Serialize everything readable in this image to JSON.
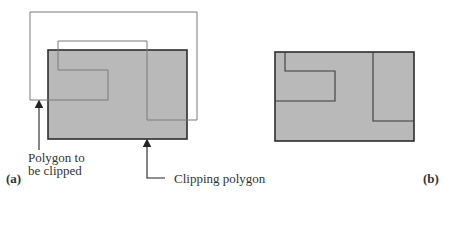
{
  "figure": {
    "colors": {
      "clip_fill": "#b9b9b9",
      "clip_stroke": "#2e2e2e",
      "subject_stroke": "#7a7a7a",
      "result_stroke": "#3a3a3a",
      "arrow": "#222222"
    },
    "panel_a": {
      "label": "(a)",
      "subject_label_line1": "Polygon to",
      "subject_label_line2": "be clipped",
      "clip_label": "Clipping polygon"
    },
    "panel_b": {
      "label": "(b)"
    }
  }
}
